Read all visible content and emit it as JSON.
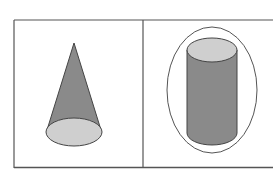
{
  "figure": {
    "panels": [
      {
        "shape": "cone",
        "label": ""
      },
      {
        "shape": "cylinder-inscribed-in-ellipse",
        "label": ""
      }
    ],
    "colors": {
      "border": "#555555",
      "side_fill": "#8a8a8a",
      "base_fill": "#cfcfcf",
      "outline": "#444444"
    }
  }
}
